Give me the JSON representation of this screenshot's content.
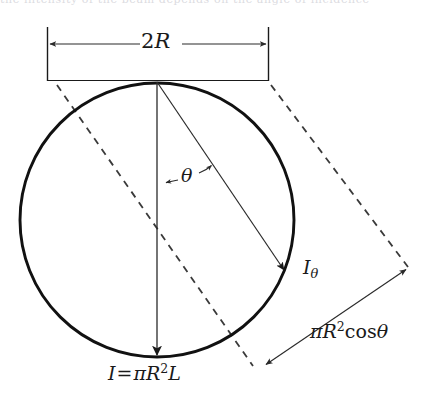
{
  "figure": {
    "name": "cylinder-projected-area-diagram",
    "background_color": "#ffffff",
    "stroke_color": "#1a1a1a",
    "dash_color": "#3a3a3a",
    "thin_stroke_color": "#555555"
  },
  "bleed_text": {
    "clipped_line": "the intensity of the beam depends on the angle of incidence"
  },
  "labels": {
    "diameter": {
      "name": "2R",
      "number": "2",
      "symbol": "R"
    },
    "angle": {
      "name": "theta",
      "symbol": "θ"
    },
    "angled_intensity": {
      "name": "I subscript theta",
      "symbol": "I",
      "subscript": "θ"
    },
    "total_intensity": {
      "name": "I equals pi R squared L",
      "symbol": "I",
      "equals": "=",
      "pi": "π",
      "radius": "R",
      "exponent": "2",
      "length": "L"
    },
    "projected_area": {
      "name": "pi R squared cos theta",
      "pi": "π",
      "radius": "R",
      "exponent": "2",
      "cos": "cos",
      "angle": "θ"
    }
  },
  "geometry": {
    "circle": {
      "cx": 157,
      "cy": 220,
      "r": 137
    },
    "dimension_bracket": {
      "left_x": 47,
      "right_x": 268,
      "top_y": 27,
      "bottom_y": 80,
      "arrow_y": 44
    },
    "vertical_arrow": {
      "x": 157,
      "y1": 82,
      "y2": 357
    },
    "angled_arrow": {
      "x1": 157,
      "y1": 82,
      "x2": 285,
      "y2": 272
    },
    "dashed_left": {
      "x1": 57,
      "y1": 85,
      "x2": 253,
      "y2": 366
    },
    "dashed_right": {
      "x1": 271,
      "y1": 85,
      "x2": 408,
      "y2": 267
    },
    "projection_arrow": {
      "x1": 264,
      "y1": 366,
      "x2": 407,
      "y2": 268
    },
    "theta_arc_arrow": {
      "x1": 164,
      "y1": 183,
      "x2": 212,
      "y2": 164
    }
  }
}
